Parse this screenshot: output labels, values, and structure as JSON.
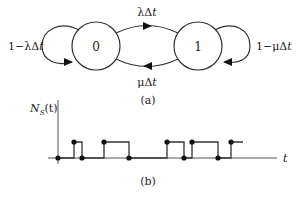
{
  "diagram_a": {
    "caption": "(a)",
    "states": [
      {
        "id": "state-0",
        "label": "0"
      },
      {
        "id": "state-1",
        "label": "1"
      }
    ],
    "transitions": [
      {
        "from": "0",
        "to": "1",
        "label": "λΔt"
      },
      {
        "from": "1",
        "to": "0",
        "label": "μΔt"
      },
      {
        "from": "0",
        "to": "0",
        "label": "1−λΔt"
      },
      {
        "from": "1",
        "to": "1",
        "label": "1−μΔt"
      }
    ],
    "labels": {
      "lambda_prefix": "λΔ",
      "mu_prefix": "μΔ",
      "self0_prefix": "1−λΔ",
      "self1_prefix": "1−μΔ",
      "t": "t"
    }
  },
  "diagram_b": {
    "caption": "(b)",
    "y_label_main": "N",
    "y_label_sub": "S",
    "y_label_arg": "(t)",
    "x_label": "t",
    "step_transitions_x": [
      74,
      82,
      104,
      129,
      167,
      184,
      192,
      218,
      231
    ],
    "step_levels": "alternating 0/1 starting at 0",
    "colors": {
      "line": "#222222",
      "dot": "#111111"
    }
  }
}
